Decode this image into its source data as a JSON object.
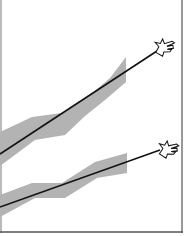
{
  "diagram": {
    "colors": {
      "background": "#ffffff",
      "band": "#b3b3b3",
      "line": "#111111",
      "frame": "#555555"
    },
    "frame": {
      "right_x": 182,
      "bottom_y": 232,
      "left_x": 1
    },
    "trends": [
      {
        "id": "upper",
        "line": {
          "x1": 0,
          "y1": 154,
          "x2": 160,
          "y2": 49
        },
        "band_polygon": "0,132 32,117 62,113 90,95 110,78 126,57 126,82 105,100 85,116 65,135 35,140 0,166",
        "pointer_icon": "pointing-hand-icon",
        "pointer_pos": {
          "x": 163,
          "y": 47
        }
      },
      {
        "id": "lower",
        "line": {
          "x1": 0,
          "y1": 207,
          "x2": 160,
          "y2": 150
        },
        "band_polygon": "0,195 32,183 62,183 95,162 127,153 127,173 97,178 65,198 35,198 0,217",
        "pointer_icon": "pointing-hand-icon",
        "pointer_pos": {
          "x": 167,
          "y": 149
        }
      }
    ]
  }
}
